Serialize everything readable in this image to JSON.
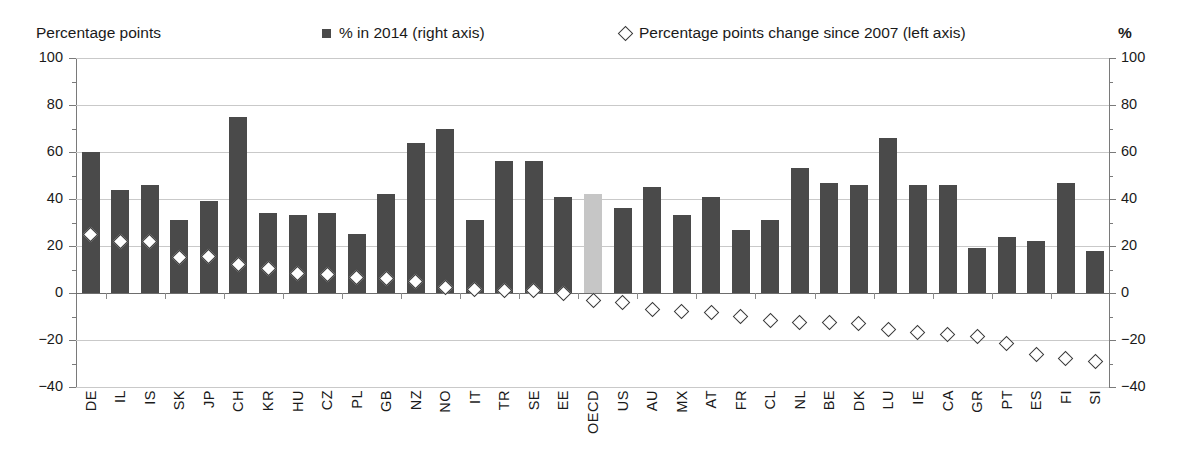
{
  "header": {
    "left_axis_title": "Percentage points",
    "right_axis_title": "%",
    "legend": [
      {
        "label": "% in 2014 (right axis)",
        "marker": "filled-square-icon",
        "color": "#4a4a4a"
      },
      {
        "label": "Percentage points change since 2007 (left axis)",
        "marker": "open-diamond-icon",
        "color": "#3b3b3b"
      }
    ]
  },
  "colors": {
    "bar": "#4a4a4a",
    "bar_highlight": "#c6c6c6",
    "marker_stroke": "#3b3b3b",
    "marker_fill": "#ffffff",
    "gridline": "#c9c9c9",
    "axis": "#7a7a7a"
  },
  "chart_data": {
    "type": "bar",
    "title": "",
    "subtitle": "",
    "xlabel": "",
    "ylabel": "Percentage points",
    "y2label": "%",
    "ylim": [
      -40,
      100
    ],
    "y2lim": [
      -40,
      100
    ],
    "yticks": [
      -40,
      -20,
      0,
      20,
      40,
      60,
      80,
      100
    ],
    "y2ticks": [
      -40,
      -20,
      0,
      20,
      40,
      60,
      80,
      100
    ],
    "grid": true,
    "legend_position": "top",
    "highlight_category": "OECD",
    "categories": [
      "DE",
      "IL",
      "IS",
      "SK",
      "JP",
      "CH",
      "KR",
      "HU",
      "CZ",
      "PL",
      "GB",
      "NZ",
      "NO",
      "IT",
      "TR",
      "SE",
      "EE",
      "OECD",
      "US",
      "AU",
      "MX",
      "AT",
      "FR",
      "CL",
      "NL",
      "BE",
      "DK",
      "LU",
      "IE",
      "CA",
      "GR",
      "PT",
      "ES",
      "FI",
      "SI"
    ],
    "series": [
      {
        "name": "% in 2014 (right axis)",
        "type": "bar",
        "axis": "right",
        "values": [
          60,
          44,
          46,
          31,
          39,
          75,
          34,
          33,
          34,
          25,
          42,
          64,
          70,
          31,
          56,
          56,
          41,
          42,
          36,
          45,
          33,
          41,
          27,
          31,
          53,
          47,
          46,
          66,
          46,
          46,
          19,
          24,
          22,
          47,
          18
        ]
      },
      {
        "name": "Percentage points change since 2007 (left axis)",
        "type": "scatter",
        "axis": "left",
        "values": [
          25,
          22,
          22,
          15,
          15.5,
          12,
          10.5,
          8.5,
          8,
          6.5,
          6,
          5,
          2.5,
          1.5,
          1,
          1,
          0,
          -3,
          -4,
          -7,
          -8,
          -8.5,
          -10,
          -11.5,
          -12.5,
          -12.5,
          -13,
          -15.5,
          -17,
          -17.5,
          -18.5,
          -21.5,
          -26,
          -28,
          -29
        ]
      }
    ]
  }
}
